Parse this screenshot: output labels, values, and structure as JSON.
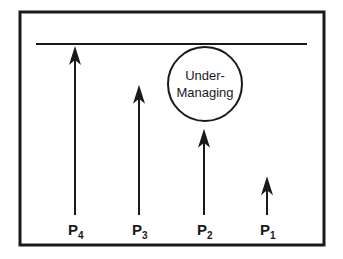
{
  "diagram": {
    "limit_line": {
      "label": ""
    },
    "circle_label": {
      "line1": "Under-",
      "line2": "Managing"
    },
    "arrows": [
      {
        "id": "p4",
        "label_main": "P",
        "label_sub": "4",
        "level": 1.0
      },
      {
        "id": "p3",
        "label_main": "P",
        "label_sub": "3",
        "level": 0.77
      },
      {
        "id": "p2",
        "label_main": "P",
        "label_sub": "2",
        "level": 0.51
      },
      {
        "id": "p1",
        "label_main": "P",
        "label_sub": "1",
        "level": 0.23
      }
    ],
    "colors": {
      "stroke": "#1a1a1a",
      "background": "#ffffff"
    }
  }
}
